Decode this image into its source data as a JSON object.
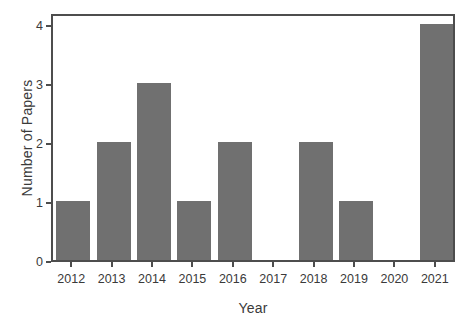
{
  "chart_data": {
    "type": "bar",
    "title": "",
    "subtitle": "",
    "xlabel": "Year",
    "ylabel": "Number of Papers",
    "categories": [
      "2012",
      "2013",
      "2014",
      "2015",
      "2016",
      "2017",
      "2018",
      "2019",
      "2020",
      "2021"
    ],
    "values": [
      1,
      2,
      3,
      1,
      2,
      0,
      2,
      1,
      0,
      4
    ],
    "series": [
      {
        "name": "Number of Papers",
        "values": [
          1,
          2,
          3,
          1,
          2,
          0,
          2,
          1,
          0,
          4
        ]
      }
    ],
    "ylim": [
      0,
      4.2
    ],
    "yticks": [
      "0",
      "1",
      "2",
      "3",
      "4"
    ],
    "ytick_values": [
      0,
      1,
      2,
      3,
      4
    ],
    "xticks": [
      "2012",
      "2013",
      "2014",
      "2015",
      "2016",
      "2017",
      "2018",
      "2019",
      "2020",
      "2021"
    ],
    "grid": false,
    "legend": false,
    "legend_position": "none",
    "annotations": [],
    "bar_color": "#707070",
    "frame_color": "#4d4d4d",
    "background_color": "#ffffff",
    "text_color": "#3a3a3a"
  }
}
